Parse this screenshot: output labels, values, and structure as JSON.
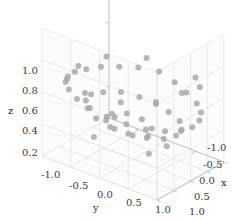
{
  "figure": {
    "width": 250,
    "height": 220,
    "background": "#ffffff",
    "pane_color": "#fcfcfc",
    "grid_color": "#e3e3e3",
    "axis_line_color": "#bdbdbd",
    "tick_text_color": "#3c3c3c"
  },
  "chart_data": {
    "type": "scatter",
    "projection": "3d",
    "title": "",
    "xlabel": "x",
    "ylabel": "y",
    "zlabel": "z",
    "xlim": [
      -1.0,
      1.0
    ],
    "ylim": [
      -1.0,
      1.0
    ],
    "zlim": [
      0.2,
      1.0
    ],
    "xticks": [
      -1.0,
      -0.5,
      0.0,
      0.5,
      1.0
    ],
    "yticks": [
      -1.0,
      -0.5,
      0.0,
      0.5,
      1.0
    ],
    "zticks": [
      0.2,
      0.4,
      0.6,
      0.8,
      1.0
    ],
    "xtick_labels": [
      "-1.0",
      "-0.5",
      "0.0",
      "0.5",
      "1.0"
    ],
    "ytick_labels": [
      "-1.0",
      "-0.5",
      "0.0",
      "0.5",
      "1.0"
    ],
    "ztick_labels": [
      "0.2",
      "0.4",
      "0.6",
      "0.8",
      "1.0"
    ],
    "x_axis_reversed": true,
    "grid": true,
    "legend": null,
    "marker": {
      "shape": "circle",
      "color": "#a9a9a9",
      "size_px": 6,
      "opacity": 0.85
    },
    "point_count": 60,
    "pattern": "ring of points scattered on a curved band, plus a few scattered outliers",
    "points": [
      {
        "x": -0.95,
        "y": -0.1,
        "z": 0.62
      },
      {
        "x": -0.9,
        "y": 0.2,
        "z": 0.6
      },
      {
        "x": -0.82,
        "y": 0.45,
        "z": 0.58
      },
      {
        "x": -0.7,
        "y": 0.7,
        "z": 0.56
      },
      {
        "x": -0.52,
        "y": 0.88,
        "z": 0.55
      },
      {
        "x": -0.3,
        "y": 0.98,
        "z": 0.54
      },
      {
        "x": -0.05,
        "y": 1.0,
        "z": 0.53
      },
      {
        "x": 0.2,
        "y": 0.95,
        "z": 0.53
      },
      {
        "x": 0.45,
        "y": 0.82,
        "z": 0.54
      },
      {
        "x": 0.68,
        "y": 0.62,
        "z": 0.55
      },
      {
        "x": 0.85,
        "y": 0.38,
        "z": 0.57
      },
      {
        "x": 0.95,
        "y": 0.1,
        "z": 0.59
      },
      {
        "x": 0.98,
        "y": -0.18,
        "z": 0.61
      },
      {
        "x": 0.9,
        "y": -0.45,
        "z": 0.62
      },
      {
        "x": 0.75,
        "y": -0.68,
        "z": 0.63
      },
      {
        "x": 0.55,
        "y": -0.85,
        "z": 0.63
      },
      {
        "x": 0.3,
        "y": -0.96,
        "z": 0.62
      },
      {
        "x": 0.02,
        "y": -1.0,
        "z": 0.61
      },
      {
        "x": -0.25,
        "y": -0.96,
        "z": 0.6
      },
      {
        "x": -0.5,
        "y": -0.85,
        "z": 0.6
      },
      {
        "x": -0.72,
        "y": -0.66,
        "z": 0.6
      },
      {
        "x": -0.88,
        "y": -0.42,
        "z": 0.61
      },
      {
        "x": -0.6,
        "y": 0.05,
        "z": 0.48
      },
      {
        "x": -0.55,
        "y": 0.3,
        "z": 0.47
      },
      {
        "x": -0.45,
        "y": 0.55,
        "z": 0.46
      },
      {
        "x": -0.25,
        "y": 0.7,
        "z": 0.45
      },
      {
        "x": 0.0,
        "y": 0.75,
        "z": 0.45
      },
      {
        "x": 0.25,
        "y": 0.68,
        "z": 0.45
      },
      {
        "x": 0.48,
        "y": 0.52,
        "z": 0.46
      },
      {
        "x": 0.62,
        "y": 0.28,
        "z": 0.47
      },
      {
        "x": 0.68,
        "y": 0.0,
        "z": 0.48
      },
      {
        "x": 0.62,
        "y": -0.28,
        "z": 0.49
      },
      {
        "x": 0.46,
        "y": -0.52,
        "z": 0.5
      },
      {
        "x": 0.24,
        "y": -0.68,
        "z": 0.5
      },
      {
        "x": -0.02,
        "y": -0.74,
        "z": 0.5
      },
      {
        "x": -0.28,
        "y": -0.68,
        "z": 0.49
      },
      {
        "x": -0.5,
        "y": -0.5,
        "z": 0.49
      },
      {
        "x": -0.62,
        "y": -0.25,
        "z": 0.48
      },
      {
        "x": -0.35,
        "y": -0.05,
        "z": 0.4
      },
      {
        "x": -0.18,
        "y": 0.22,
        "z": 0.4
      },
      {
        "x": 0.1,
        "y": 0.32,
        "z": 0.4
      },
      {
        "x": 0.32,
        "y": 0.18,
        "z": 0.41
      },
      {
        "x": 0.38,
        "y": -0.1,
        "z": 0.42
      },
      {
        "x": 0.22,
        "y": -0.34,
        "z": 0.42
      },
      {
        "x": -0.06,
        "y": -0.4,
        "z": 0.42
      },
      {
        "x": -0.3,
        "y": -0.28,
        "z": 0.41
      },
      {
        "x": -0.8,
        "y": 0.62,
        "z": 0.7
      },
      {
        "x": -0.45,
        "y": 0.9,
        "z": 0.72
      },
      {
        "x": 0.05,
        "y": 0.88,
        "z": 0.74
      },
      {
        "x": 0.55,
        "y": 0.72,
        "z": 0.72
      },
      {
        "x": 0.88,
        "y": 0.3,
        "z": 0.7
      },
      {
        "x": 0.92,
        "y": -0.3,
        "z": 0.68
      },
      {
        "x": 0.6,
        "y": -0.8,
        "z": 0.66
      },
      {
        "x": 0.0,
        "y": -0.95,
        "z": 0.65
      },
      {
        "x": -0.58,
        "y": -0.8,
        "z": 0.66
      },
      {
        "x": -0.92,
        "y": -0.3,
        "z": 0.68
      },
      {
        "x": -0.15,
        "y": 0.5,
        "z": 0.33
      },
      {
        "x": 0.3,
        "y": 0.45,
        "z": 0.33
      },
      {
        "x": 0.48,
        "y": -0.4,
        "z": 0.34
      },
      {
        "x": -0.4,
        "y": -0.55,
        "z": 0.34
      }
    ]
  },
  "axis_titles": {
    "x": "x",
    "y": "y",
    "z": "z"
  }
}
